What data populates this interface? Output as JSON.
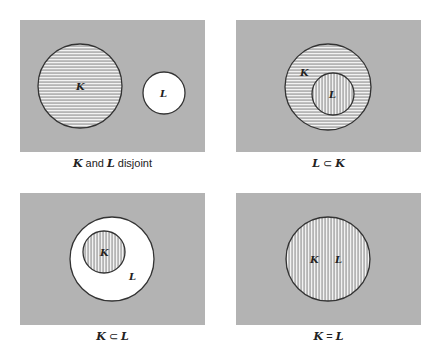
{
  "diagrams": [
    {
      "caption": {
        "a": "K",
        "mid": " and ",
        "b": "L",
        "end": " disjoint"
      },
      "sets": [
        {
          "name": "K",
          "fill": "horizontal-hatch"
        },
        {
          "name": "L",
          "fill": "white"
        }
      ]
    },
    {
      "caption": {
        "a": "L",
        "op": " ⊂ ",
        "b": "K"
      },
      "sets": [
        {
          "name": "K",
          "fill": "horizontal-hatch"
        },
        {
          "name": "L",
          "fill": "vertical-hatch"
        }
      ]
    },
    {
      "caption": {
        "a": "K",
        "op": " ⊂ ",
        "b": "L"
      },
      "sets": [
        {
          "name": "L",
          "fill": "white"
        },
        {
          "name": "K",
          "fill": "vertical-hatch"
        }
      ]
    },
    {
      "caption": {
        "a": "K",
        "op": " = ",
        "b": "L"
      },
      "sets": [
        {
          "name": "K",
          "fill": "vertical-hatch"
        },
        {
          "name": "L",
          "fill": "vertical-hatch"
        }
      ]
    }
  ],
  "colors": {
    "universe": "#b3b3b3",
    "stroke": "#333333",
    "hatch_line": "#ffffff",
    "hatch_bg": "#b8b8b8"
  }
}
